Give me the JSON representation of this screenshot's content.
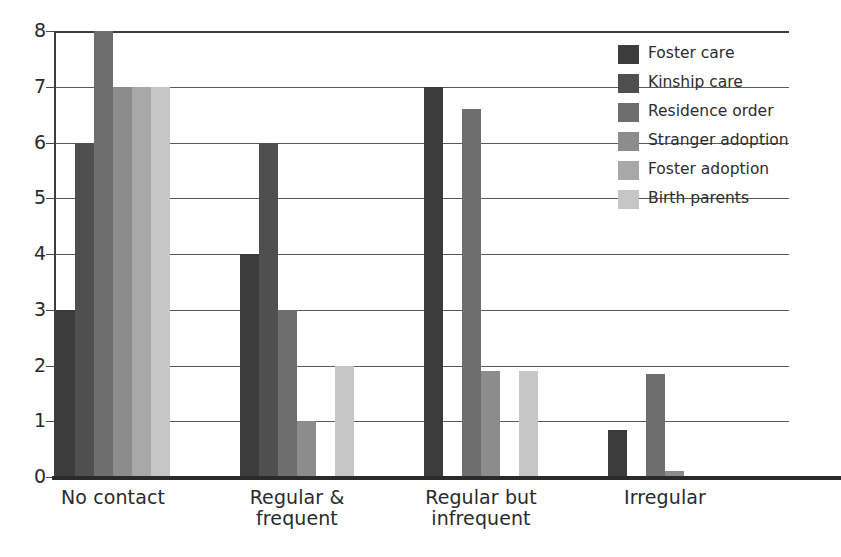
{
  "chart_data": {
    "type": "bar",
    "title": "",
    "xlabel": "",
    "ylabel": "",
    "ylim": [
      0,
      8
    ],
    "yticks": [
      0,
      1,
      2,
      3,
      4,
      5,
      6,
      7,
      8
    ],
    "grid": true,
    "legend_position": "top-right",
    "categories": [
      "No contact",
      "Regular & frequent",
      "Regular but infrequent",
      "Irregular"
    ],
    "category_lines": [
      [
        "No contact"
      ],
      [
        "Regular &",
        "frequent"
      ],
      [
        "Regular but",
        "infrequent"
      ],
      [
        "Irregular"
      ]
    ],
    "series": [
      {
        "name": "Foster care",
        "color": "#3c3c3c",
        "values": [
          3,
          4,
          7,
          0.85
        ]
      },
      {
        "name": "Kinship care",
        "color": "#4f4f4f",
        "values": [
          6,
          6,
          0,
          0
        ]
      },
      {
        "name": "Residence order",
        "color": "#6e6e6e",
        "values": [
          8,
          3,
          6.6,
          1.85
        ]
      },
      {
        "name": "Stranger adoption",
        "color": "#8c8c8c",
        "values": [
          7,
          1,
          1.9,
          0.1
        ]
      },
      {
        "name": "Foster adoption",
        "color": "#a8a8a8",
        "values": [
          7,
          0,
          0,
          0
        ]
      },
      {
        "name": "Birth parents",
        "color": "#c6c6c6",
        "values": [
          7,
          2,
          1.9,
          0
        ]
      }
    ]
  },
  "legend": {
    "items": [
      {
        "label": "Foster care",
        "color": "#3c3c3c"
      },
      {
        "label": "Kinship care",
        "color": "#4f4f4f"
      },
      {
        "label": "Residence order",
        "color": "#6e6e6e"
      },
      {
        "label": "Stranger adoption",
        "color": "#8c8c8c"
      },
      {
        "label": "Foster adoption",
        "color": "#a8a8a8"
      },
      {
        "label": "Birth parents",
        "color": "#c6c6c6"
      }
    ]
  },
  "axis": {
    "y_tick_labels": [
      "8",
      "7",
      "6",
      "5",
      "4",
      "3",
      "2",
      "1",
      "0"
    ]
  }
}
